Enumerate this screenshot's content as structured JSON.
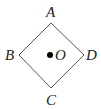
{
  "diagram": {
    "shape": "square rotated 45 degrees (rhombus)",
    "vertices": [
      {
        "name": "A",
        "label": "A",
        "position": "top"
      },
      {
        "name": "B",
        "label": "B",
        "position": "left"
      },
      {
        "name": "C",
        "label": "C",
        "position": "bottom"
      },
      {
        "name": "D",
        "label": "D",
        "position": "right"
      }
    ],
    "center": {
      "name": "O",
      "label": "O",
      "marker": "filled dot"
    },
    "colors": {
      "stroke": "#555555",
      "text": "#222222",
      "dot": "#000000"
    }
  }
}
